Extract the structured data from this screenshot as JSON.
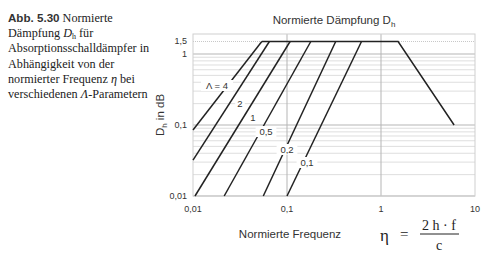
{
  "caption": {
    "number": "Abb. 5.30",
    "text_part1": "Normierte Dämpfung ",
    "symbol": "D",
    "symbol_sub": "h",
    "text_part2": " für Absorptionsschalldämpfer in Abhängigkeit von der normierter Frequenz ",
    "eta": "η",
    "text_part3": " bei verschiedenen ",
    "lambda": "Λ",
    "text_part4": "-Parametern"
  },
  "formula": {
    "lhs": "η",
    "eq": "=",
    "numerator": "2 h · f",
    "denominator": "c"
  },
  "chart_data": {
    "type": "line",
    "title_main": "Normierte Dämpfung D",
    "title_sub": "h",
    "xlabel": "Normierte Frequenz",
    "ylabel": "D_h in dB",
    "ylabel_main": "D",
    "ylabel_sub": "h",
    "ylabel_rest": " in dB",
    "xscale": "log",
    "yscale": "log",
    "xlim": [
      0.01,
      10
    ],
    "ylim": [
      0.01,
      1.5
    ],
    "x_ticks": [
      {
        "value": 0.01,
        "label": "0,01"
      },
      {
        "value": 0.1,
        "label": "0,1"
      },
      {
        "value": 1,
        "label": "1"
      },
      {
        "value": 10,
        "label": "10"
      }
    ],
    "y_ticks": [
      {
        "value": 0.01,
        "label": "0,01"
      },
      {
        "value": 0.1,
        "label": "0,1"
      },
      {
        "value": 1,
        "label": "1"
      },
      {
        "value": 1.5,
        "label": "1,5"
      }
    ],
    "grid": true,
    "legend": "inline labels",
    "plateau_value": 1.5,
    "series": [
      {
        "name": "Λ = 4",
        "label": "Λ = 4",
        "points": [
          [
            0.01,
            0.085
          ],
          [
            0.054,
            1.5
          ]
        ]
      },
      {
        "name": "Λ = 2",
        "label": "2",
        "points": [
          [
            0.01,
            0.032
          ],
          [
            0.065,
            1.5
          ]
        ]
      },
      {
        "name": "Λ = 1",
        "label": "1",
        "points": [
          [
            0.0105,
            0.01
          ],
          [
            0.108,
            1.5
          ]
        ]
      },
      {
        "name": "Λ = 0,5",
        "label": "0,5",
        "points": [
          [
            0.0215,
            0.01
          ],
          [
            0.179,
            1.5
          ]
        ]
      },
      {
        "name": "Λ = 0,2",
        "label": "0,2",
        "points": [
          [
            0.056,
            0.01
          ],
          [
            0.33,
            1.5
          ]
        ]
      },
      {
        "name": "Λ = 0,1",
        "label": "0,1",
        "points": [
          [
            0.1,
            0.01
          ],
          [
            0.62,
            1.5
          ]
        ]
      }
    ],
    "envelope": {
      "name": "plateau and high-frequency roll-off",
      "points": [
        [
          0.054,
          1.5
        ],
        [
          1.52,
          1.5
        ],
        [
          6.0,
          0.1
        ]
      ]
    }
  }
}
